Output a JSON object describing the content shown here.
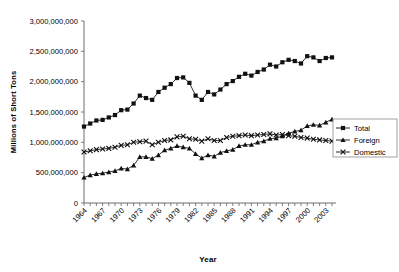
{
  "chart_data": {
    "type": "line",
    "title": "",
    "xlabel": "Year",
    "ylabel": "Millions of Short Tons",
    "xlim": [
      1964,
      2004
    ],
    "ylim": [
      0,
      3000000000
    ],
    "ytick_values": [
      0,
      500000000,
      1000000000,
      1500000000,
      2000000000,
      2500000000,
      3000000000
    ],
    "ytick_labels": [
      "0",
      "500,000,000",
      "1,000,000,000",
      "1,500,000,000",
      "2,000,000,000",
      "2,500,000,000",
      "3,000,000,000"
    ],
    "xtick_labels": [
      "1964",
      "1967",
      "1970",
      "1973",
      "1976",
      "1979",
      "1982",
      "1985",
      "1988",
      "1991",
      "1994",
      "1997",
      "2000",
      "2003"
    ],
    "xtick_step": 3,
    "minor_xticks_every": 1,
    "grid": false,
    "legend_position": "right-middle",
    "x": [
      1964,
      1965,
      1966,
      1967,
      1968,
      1969,
      1970,
      1971,
      1972,
      1973,
      1974,
      1975,
      1976,
      1977,
      1978,
      1979,
      1980,
      1981,
      1982,
      1983,
      1984,
      1985,
      1986,
      1987,
      1988,
      1989,
      1990,
      1991,
      1992,
      1993,
      1994,
      1995,
      1996,
      1997,
      1998,
      1999,
      2000,
      2001,
      2002,
      2003,
      2004
    ],
    "series": [
      {
        "name": "Total",
        "marker": "square",
        "values": [
          1260000000,
          1310000000,
          1360000000,
          1370000000,
          1410000000,
          1450000000,
          1530000000,
          1540000000,
          1640000000,
          1770000000,
          1730000000,
          1700000000,
          1830000000,
          1900000000,
          1960000000,
          2060000000,
          2070000000,
          1980000000,
          1770000000,
          1700000000,
          1830000000,
          1790000000,
          1870000000,
          1960000000,
          2010000000,
          2080000000,
          2130000000,
          2100000000,
          2160000000,
          2200000000,
          2280000000,
          2250000000,
          2320000000,
          2360000000,
          2340000000,
          2300000000,
          2420000000,
          2400000000,
          2340000000,
          2390000000,
          2400000000
        ]
      },
      {
        "name": "Foreign",
        "marker": "triangle",
        "values": [
          420000000,
          460000000,
          480000000,
          490000000,
          510000000,
          530000000,
          570000000,
          560000000,
          620000000,
          760000000,
          760000000,
          730000000,
          790000000,
          870000000,
          900000000,
          940000000,
          920000000,
          900000000,
          810000000,
          740000000,
          790000000,
          770000000,
          830000000,
          860000000,
          880000000,
          940000000,
          960000000,
          960000000,
          1000000000,
          1020000000,
          1060000000,
          1070000000,
          1100000000,
          1150000000,
          1180000000,
          1200000000,
          1270000000,
          1290000000,
          1280000000,
          1330000000,
          1380000000
        ]
      },
      {
        "name": "Domestic",
        "marker": "x",
        "values": [
          840000000,
          860000000,
          880000000,
          890000000,
          900000000,
          920000000,
          950000000,
          960000000,
          1000000000,
          1010000000,
          1020000000,
          960000000,
          1000000000,
          1030000000,
          1040000000,
          1090000000,
          1100000000,
          1060000000,
          1050000000,
          1020000000,
          1060000000,
          1030000000,
          1030000000,
          1080000000,
          1100000000,
          1110000000,
          1120000000,
          1110000000,
          1120000000,
          1130000000,
          1140000000,
          1120000000,
          1130000000,
          1110000000,
          1100000000,
          1080000000,
          1070000000,
          1050000000,
          1040000000,
          1030000000,
          1020000000
        ]
      }
    ],
    "legend": [
      {
        "label": "Total",
        "marker": "square"
      },
      {
        "label": "Foreign",
        "marker": "triangle"
      },
      {
        "label": "Domestic",
        "marker": "x"
      }
    ]
  }
}
